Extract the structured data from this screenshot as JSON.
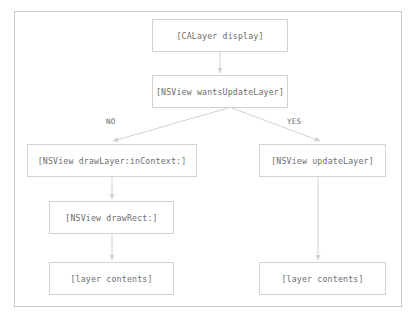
{
  "diagram": {
    "stroke_color": "#d2d2d2",
    "frame_color": "#c9c9c9",
    "text_color": "#6d6d6d",
    "background": "#ffffff",
    "nodes": [
      {
        "id": "calayer-display",
        "label": "[CALayer display]"
      },
      {
        "id": "wants-update-layer",
        "label": "[NSView wantsUpdateLayer]"
      },
      {
        "id": "draw-layer-incontext",
        "label": "[NSView drawLayer:inContext:]"
      },
      {
        "id": "update-layer",
        "label": "[NSView updateLayer]"
      },
      {
        "id": "draw-rect",
        "label": "[NSView drawRect:]"
      },
      {
        "id": "layer-contents-left",
        "label": "[layer contents]"
      },
      {
        "id": "layer-contents-right",
        "label": "[layer contents]"
      }
    ],
    "edges": [
      {
        "from": "calayer-display",
        "to": "wants-update-layer",
        "label": ""
      },
      {
        "from": "wants-update-layer",
        "to": "draw-layer-incontext",
        "label": "NO"
      },
      {
        "from": "wants-update-layer",
        "to": "update-layer",
        "label": "YES"
      },
      {
        "from": "draw-layer-incontext",
        "to": "draw-rect",
        "label": ""
      },
      {
        "from": "draw-rect",
        "to": "layer-contents-left",
        "label": ""
      },
      {
        "from": "update-layer",
        "to": "layer-contents-right",
        "label": ""
      }
    ]
  }
}
